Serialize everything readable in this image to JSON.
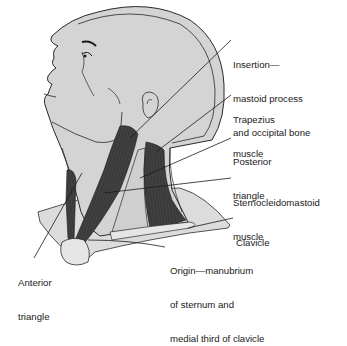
{
  "figure": {
    "colors": {
      "skin": "#d4d4d4",
      "skin_light": "#e2e2e2",
      "muscle": "#3a3a3a",
      "outline": "#2a2a2a",
      "background": "#ffffff"
    },
    "labels": [
      {
        "id": "insertion",
        "line1": "Insertion—",
        "line2": "mastoid process",
        "line3": "and occipital bone"
      },
      {
        "id": "trapezius",
        "line1": "Trapezius",
        "line2": "muscle"
      },
      {
        "id": "posterior-triangle",
        "line1": "Posterior",
        "line2": "triangle"
      },
      {
        "id": "sternocleidomastoid",
        "line1": "Sternocleidomastoid",
        "line2": "muscle"
      },
      {
        "id": "clavicle",
        "line1": "Clavicle"
      },
      {
        "id": "origin",
        "line1": "Origin—manubrium",
        "line2": "of sternum and",
        "line3": "medial third of clavicle"
      },
      {
        "id": "anterior-triangle",
        "line1": "Anterior",
        "line2": "triangle"
      }
    ]
  }
}
